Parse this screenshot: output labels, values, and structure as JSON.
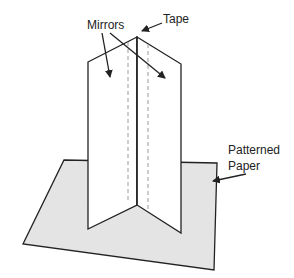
{
  "diagram": {
    "labels": {
      "mirrors": "Mirrors",
      "tape": "Tape",
      "patterned_line1": "Patterned",
      "patterned_line2": "Paper"
    },
    "colors": {
      "stroke": "#222222",
      "paper_fill": "#e4e4e4",
      "mirror_fill": "#ffffff",
      "dash": "#9a9a9a"
    }
  }
}
